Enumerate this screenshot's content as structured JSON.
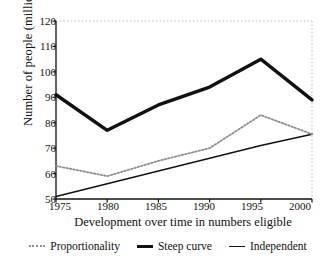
{
  "chart_data": {
    "type": "line",
    "title": "",
    "xlabel": "Development over time in numbers eligible",
    "ylabel": "Number of people (million)",
    "categories": [
      "1975",
      "1980",
      "1985",
      "1990",
      "1995",
      "2000"
    ],
    "x": [
      1975,
      1980,
      1985,
      1990,
      1995,
      2000
    ],
    "xlim": [
      1975,
      2000
    ],
    "ylim": [
      50,
      120
    ],
    "yticks": [
      50,
      60,
      70,
      80,
      90,
      100,
      110,
      120
    ],
    "xticks": [
      "1975",
      "1980",
      "1985",
      "1990",
      "1995",
      "2000"
    ],
    "grid": "dotted-border-only",
    "legend_position": "bottom",
    "series": [
      {
        "name": "Proportionality",
        "style": "dotted",
        "color": "#8e8e8e",
        "values": [
          63,
          59,
          65,
          70,
          83,
          75.5
        ]
      },
      {
        "name": "Steep curve",
        "style": "thick-solid",
        "color": "#111111",
        "values": [
          91,
          77,
          87,
          94,
          105,
          89
        ]
      },
      {
        "name": "Independent",
        "style": "thin-solid",
        "color": "#111111",
        "values": [
          51,
          56,
          61,
          66,
          71,
          75.5
        ]
      }
    ]
  },
  "axes": {
    "y_title": "Number of people (million)",
    "x_title": "Development over time in numbers eligible",
    "y_tick_labels": [
      "120",
      "110",
      "100",
      "90",
      "80",
      "70",
      "60",
      "50"
    ],
    "x_tick_labels": [
      "1975",
      "1980",
      "1985",
      "1990",
      "1995",
      "2000"
    ]
  },
  "legend": {
    "items": [
      {
        "label": "Proportionality"
      },
      {
        "label": "Steep curve"
      },
      {
        "label": "Independent"
      }
    ]
  }
}
